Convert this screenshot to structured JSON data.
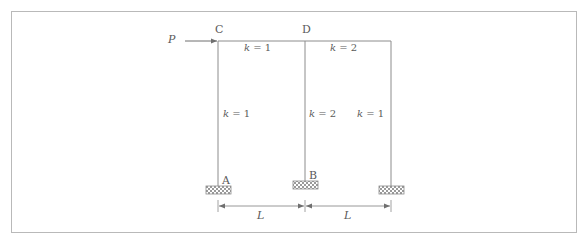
{
  "figure": {
    "border_color": "#b9b9b9",
    "line_color": "#8c8c8c",
    "text_color": "#5a5a5a",
    "hatch_color": "#9a9a9a"
  },
  "joints": {
    "top_left": "C",
    "top_middle": "D",
    "base_left": "A",
    "base_middle": "B"
  },
  "load": {
    "label": "P",
    "direction": "right",
    "applied_at": "C"
  },
  "members": {
    "beam_left": "k = 1",
    "beam_right": "k = 2",
    "column_left": "k = 1",
    "column_middle": "k = 2",
    "column_right": "k = 1"
  },
  "members_parts": {
    "beam_left_k": "k",
    "beam_left_eq": " = ",
    "beam_left_v": "1",
    "beam_right_k": "k",
    "beam_right_eq": " = ",
    "beam_right_v": "2",
    "column_left_k": "k",
    "column_left_eq": " = ",
    "column_left_v": "1",
    "column_middle_k": "k",
    "column_middle_eq": " = ",
    "column_middle_v": "2",
    "column_right_k": "k",
    "column_right_eq": " = ",
    "column_right_v": "1"
  },
  "dimensions": {
    "span_left": "L",
    "span_right": "L"
  },
  "supports": [
    {
      "name": "support-left",
      "label": "A"
    },
    {
      "name": "support-middle",
      "label": "B"
    },
    {
      "name": "support-right",
      "label": ""
    }
  ]
}
